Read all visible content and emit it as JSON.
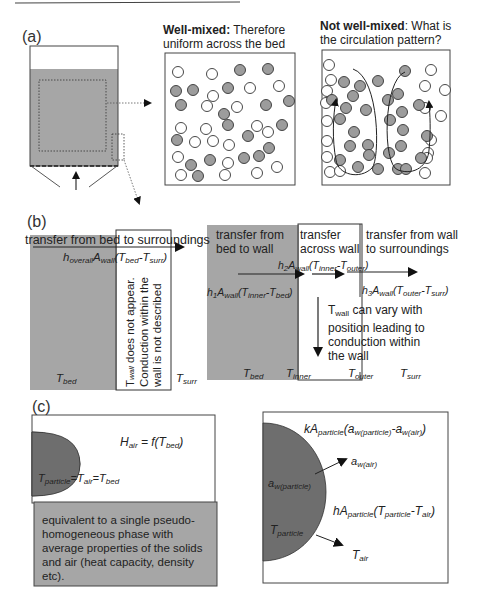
{
  "panel_a": {
    "label": "(a)",
    "well_mixed": {
      "title_bold": "Well-mixed:",
      "title_rest": " Therefore",
      "title_line2": "uniform across the bed"
    },
    "not_well_mixed": {
      "title_bold": "Not well-mixed",
      "title_rest": ": What is",
      "title_line2": "the circulation pattern?"
    },
    "particle_colors": {
      "filled": "#9c9c9c",
      "empty": "#ffffff"
    }
  },
  "panel_b": {
    "label": "(b)",
    "left": {
      "header": "transfer from bed to surroundings",
      "equation": {
        "h": "h",
        "h_sub": "overall",
        "A": "A",
        "A_sub": "wall",
        "open": "(",
        "T1": "T",
        "T1_sub": "bed",
        "minus": "-",
        "T2": "T",
        "T2_sub": "surr",
        "close": ")"
      },
      "wall_note_line1_pre": "T",
      "wall_note_line1_sub": "wall",
      "wall_note_line1_post": " does not appear.",
      "wall_note_line2": "Conduction within the",
      "wall_note_line3": "wall is not described",
      "t_bed": {
        "T": "T",
        "sub": "bed"
      },
      "t_surr": {
        "T": "T",
        "sub": "surr"
      }
    },
    "right": {
      "header_bed_to_wall_1": "transfer from",
      "header_bed_to_wall_2": "bed to wall",
      "header_across_wall_1": "transfer",
      "header_across_wall_2": "across wall",
      "header_wall_to_surr_1": "transfer from wall",
      "header_wall_to_surr_2": "to surroundings",
      "eq1": {
        "h": "h",
        "h_sub": "1",
        "A": "A",
        "A_sub": "wall",
        "open": "(",
        "T1": "T",
        "T1_sub": "inner",
        "minus": "-",
        "T2": "T",
        "T2_sub": "bed",
        "close": ")"
      },
      "eq2": {
        "h": "h",
        "h_sub": "2",
        "A": "A",
        "A_sub": "wall",
        "open": "(",
        "T1": "T",
        "T1_sub": "inner",
        "minus": "-",
        "T2": "T",
        "T2_sub": "outer",
        "close": ")"
      },
      "eq3": {
        "h": "h",
        "h_sub": "3",
        "A": "A",
        "A_sub": "wall",
        "open": "(",
        "T1": "T",
        "T1_sub": "outer",
        "minus": "-",
        "T2": "T",
        "T2_sub": "surr",
        "close": ")"
      },
      "wall_note_line1_pre": "T",
      "wall_note_line1_sub": "wall",
      "wall_note_line1_post": " can vary with",
      "wall_note_line2": "position leading to",
      "wall_note_line3": "conduction within",
      "wall_note_line4": "the wall",
      "t_bed": {
        "T": "T",
        "sub": "bed"
      },
      "t_inner": {
        "T": "T",
        "sub": "inner"
      },
      "t_outer": {
        "T": "T",
        "sub": "outer"
      },
      "t_surr": {
        "T": "T",
        "sub": "surr"
      }
    }
  },
  "panel_c": {
    "label": "(c)",
    "left": {
      "h_air": {
        "H": "H",
        "sub": "air",
        "rest": " = f(",
        "T": "T",
        "T_sub": "bed",
        "close": ")"
      },
      "equality": {
        "T1": "T",
        "T1_sub": "particle",
        "eq1": "=",
        "T2": "T",
        "T2_sub": "air",
        "eq2": "=",
        "T3": "T",
        "T3_sub": "bed"
      },
      "description": "equivalent to a single pseudo-homogeneous phase with average properties of the solids and air (heat capacity, density etc)."
    },
    "right": {
      "mass_eq": {
        "k": "k",
        "A": "A",
        "A_sub": "particle",
        "open": "(",
        "a1": "a",
        "a1_sub": "w(particle)",
        "minus": "-",
        "a2": "a",
        "a2_sub": "w(air)",
        "close": ")"
      },
      "a_w_air": {
        "a": "a",
        "sub": "w(air)"
      },
      "a_w_particle": {
        "a": "a",
        "sub": "w(particle)"
      },
      "heat_eq": {
        "h": "h",
        "A": "A",
        "A_sub": "particle",
        "open": "(",
        "T1": "T",
        "T1_sub": "particle",
        "minus": "-",
        "T2": "T",
        "T2_sub": "air",
        "close": ")"
      },
      "t_particle": {
        "T": "T",
        "sub": "particle"
      },
      "t_air": {
        "T": "T",
        "sub": "air"
      }
    }
  },
  "colors": {
    "bed_gray": "#a6a6a6",
    "particle_gray": "#6e6e6e",
    "line": "#333333"
  }
}
